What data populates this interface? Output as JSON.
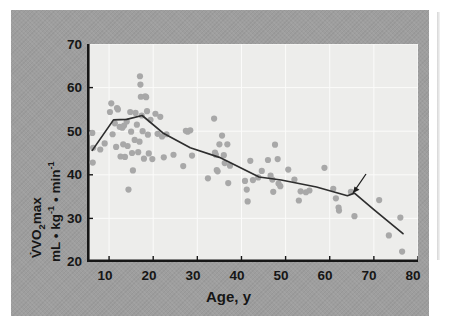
{
  "figure": {
    "panel_bg": "#9e9e9e",
    "plot_bg": "#ededeb",
    "dot_color": "#a8a8a8",
    "line_color": "#2e2e2e"
  },
  "chart_data": {
    "type": "scatter",
    "title": "",
    "xlabel": "Age, y",
    "ylabel_line1": "VO2max",
    "ylabel_line2": "mL • kg-1 • min-1",
    "ylabel_full": "V̇O2max, mL • kg⁻¹ • min⁻¹",
    "xlim": [
      5,
      80
    ],
    "ylim": [
      20,
      70
    ],
    "xticks": [
      10,
      20,
      30,
      40,
      50,
      60,
      70,
      80
    ],
    "yticks": [
      20,
      30,
      40,
      50,
      60,
      70
    ],
    "grid": true,
    "legend": "none",
    "annotations": [
      {
        "text": "Mean",
        "points_to": "mean-trend-line",
        "x": 70,
        "y": 37.5,
        "arrow": true
      }
    ],
    "series": [
      {
        "name": "Individual subjects",
        "type": "scatter",
        "marker": "filled-circle",
        "color": "#a8a8a8",
        "points": [
          [
            6.2,
            49.6
          ],
          [
            6.4,
            46.2
          ],
          [
            6.3,
            42.8
          ],
          [
            8.0,
            45.8
          ],
          [
            9.0,
            47.2
          ],
          [
            10.5,
            56.4
          ],
          [
            10.2,
            54.4
          ],
          [
            10.8,
            49.3
          ],
          [
            11.3,
            51.8
          ],
          [
            11.8,
            55.3
          ],
          [
            12.0,
            55.0
          ],
          [
            11.6,
            46.4
          ],
          [
            12.4,
            51.0
          ],
          [
            12.6,
            44.2
          ],
          [
            13.0,
            50.8
          ],
          [
            13.4,
            51.3
          ],
          [
            13.2,
            47.0
          ],
          [
            13.6,
            44.1
          ],
          [
            14.0,
            52.2
          ],
          [
            14.2,
            46.6
          ],
          [
            14.4,
            36.6
          ],
          [
            14.8,
            54.4
          ],
          [
            15.0,
            49.9
          ],
          [
            15.2,
            45.0
          ],
          [
            15.4,
            41.0
          ],
          [
            15.8,
            48.0
          ],
          [
            16.0,
            54.2
          ],
          [
            16.3,
            51.5
          ],
          [
            16.6,
            45.2
          ],
          [
            16.9,
            47.6
          ],
          [
            17.0,
            62.6
          ],
          [
            17.1,
            60.7
          ],
          [
            17.2,
            57.9
          ],
          [
            17.4,
            53.6
          ],
          [
            17.6,
            50.0
          ],
          [
            17.9,
            43.7
          ],
          [
            18.2,
            58.0
          ],
          [
            18.4,
            57.8
          ],
          [
            18.6,
            54.6
          ],
          [
            18.8,
            49.2
          ],
          [
            19.0,
            44.9
          ],
          [
            19.4,
            52.6
          ],
          [
            19.8,
            43.6
          ],
          [
            20.5,
            54.0
          ],
          [
            21.0,
            49.4
          ],
          [
            21.6,
            53.3
          ],
          [
            22.0,
            48.8
          ],
          [
            22.4,
            44.0
          ],
          [
            23.0,
            49.3
          ],
          [
            24.6,
            44.6
          ],
          [
            26.8,
            42.0
          ],
          [
            27.4,
            50.1
          ],
          [
            27.8,
            49.9
          ],
          [
            28.4,
            50.2
          ],
          [
            28.8,
            44.4
          ],
          [
            32.4,
            39.2
          ],
          [
            33.8,
            52.9
          ],
          [
            34.0,
            45.1
          ],
          [
            34.2,
            44.6
          ],
          [
            34.4,
            41.1
          ],
          [
            34.6,
            40.8
          ],
          [
            35.0,
            47.0
          ],
          [
            35.6,
            49.0
          ],
          [
            36.0,
            44.5
          ],
          [
            36.2,
            42.7
          ],
          [
            36.8,
            47.0
          ],
          [
            37.0,
            38.1
          ],
          [
            37.4,
            42.1
          ],
          [
            40.8,
            38.6
          ],
          [
            41.2,
            36.6
          ],
          [
            41.4,
            33.9
          ],
          [
            42.0,
            43.2
          ],
          [
            42.6,
            38.8
          ],
          [
            43.8,
            39.4
          ],
          [
            44.6,
            40.9
          ],
          [
            46.0,
            43.4
          ],
          [
            46.6,
            39.8
          ],
          [
            47.0,
            38.9
          ],
          [
            47.2,
            36.1
          ],
          [
            47.6,
            46.9
          ],
          [
            48.2,
            43.6
          ],
          [
            48.4,
            38.0
          ],
          [
            48.8,
            37.4
          ],
          [
            50.6,
            41.2
          ],
          [
            52.0,
            38.9
          ],
          [
            53.0,
            34.1
          ],
          [
            53.4,
            36.2
          ],
          [
            54.6,
            36.0
          ],
          [
            55.4,
            36.4
          ],
          [
            58.8,
            41.6
          ],
          [
            60.8,
            36.8
          ],
          [
            61.4,
            34.6
          ],
          [
            62.0,
            32.5
          ],
          [
            62.1,
            31.8
          ],
          [
            64.8,
            36.1
          ],
          [
            65.6,
            30.5
          ],
          [
            71.2,
            34.2
          ],
          [
            73.4,
            26.1
          ],
          [
            76.0,
            30.2
          ],
          [
            76.4,
            22.4
          ]
        ]
      },
      {
        "name": "Mean",
        "type": "line",
        "color": "#2e2e2e",
        "points": [
          [
            6.2,
            45.6
          ],
          [
            11.0,
            52.6
          ],
          [
            14.0,
            52.7
          ],
          [
            17.5,
            53.6
          ],
          [
            22.2,
            49.6
          ],
          [
            28.4,
            46.2
          ],
          [
            35.0,
            44.0
          ],
          [
            44.0,
            39.5
          ],
          [
            49.0,
            38.8
          ],
          [
            57.0,
            37.2
          ],
          [
            64.0,
            35.2
          ],
          [
            65.6,
            35.8
          ],
          [
            70.0,
            32.0
          ],
          [
            76.6,
            26.5
          ]
        ]
      }
    ]
  },
  "axis": {
    "ytick_labels": [
      "70",
      "60",
      "50",
      "40",
      "30",
      "20"
    ],
    "xtick_labels": [
      "10",
      "20",
      "30",
      "40",
      "50",
      "60",
      "70",
      "80"
    ]
  },
  "labels": {
    "x_title": "Age, y",
    "mean_annotation": "Mean",
    "y_title_main": "VO",
    "y_title_sub": "2",
    "y_title_max": "max",
    "y_title_units_ml": "mL • kg",
    "y_title_units_sup1": "-1",
    "y_title_units_min": " • min",
    "y_title_units_sup2": "-1"
  }
}
